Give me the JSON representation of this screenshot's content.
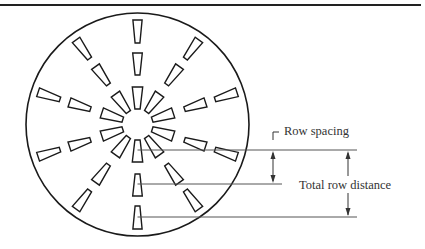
{
  "figure": {
    "type": "spray-plate-diagram",
    "rows": 3,
    "slots_per_row": 10,
    "slot_angle_step_deg": 36,
    "labels": {
      "row_spacing": "Row spacing",
      "total_row_distance": "Total row distance"
    },
    "colors": {
      "stroke": "#1a1a1a",
      "leader": "#555555",
      "text": "#333333",
      "background": "#ffffff"
    }
  }
}
